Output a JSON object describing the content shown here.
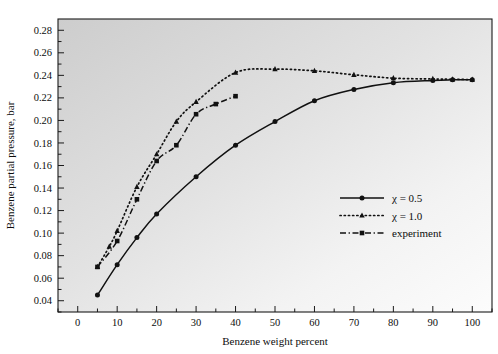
{
  "figure": {
    "background_color": "#ffffff",
    "plot_bg_light": "#fdfdfd",
    "plot_bg_dark": "#cfcfcf",
    "ink_color": "#111111"
  },
  "chart_data": {
    "type": "line",
    "title": "",
    "xlabel": "Benzene weight percent",
    "ylabel": "Benzene partial pressure, bar",
    "xlim": [
      -5,
      105
    ],
    "ylim": [
      0.03,
      0.29
    ],
    "xticks": [
      0,
      10,
      20,
      30,
      40,
      50,
      60,
      70,
      80,
      90,
      100
    ],
    "xtick_labels": [
      "0",
      "10",
      "20",
      "30",
      "40",
      "50",
      "60",
      "70",
      "80",
      "90",
      "100"
    ],
    "yticks": [
      0.04,
      0.06,
      0.08,
      0.1,
      0.12,
      0.14,
      0.16,
      0.18,
      0.2,
      0.22,
      0.24,
      0.26,
      0.28
    ],
    "ytick_labels": [
      "0.04",
      "0.06",
      "0.08",
      "0.10",
      "0.12",
      "0.14",
      "0.16",
      "0.18",
      "0.20",
      "0.22",
      "0.24",
      "0.26",
      "0.28"
    ],
    "yticks_minor": [
      0.03,
      0.05,
      0.07,
      0.09,
      0.11,
      0.13,
      0.15,
      0.17,
      0.19,
      0.21,
      0.23,
      0.25,
      0.27
    ],
    "xticks_minor": [
      -5,
      5,
      15,
      25,
      35,
      45,
      55,
      65,
      75,
      85,
      95,
      105
    ],
    "grid": false,
    "legend_position": "center-right",
    "series": [
      {
        "name": "chi-0-5",
        "label": "χ = 0.5",
        "linestyle": "solid",
        "marker": "circle",
        "x": [
          5,
          10,
          15,
          20,
          30,
          40,
          50,
          60,
          70,
          80,
          90,
          95,
          100
        ],
        "y": [
          0.045,
          0.072,
          0.096,
          0.117,
          0.15,
          0.178,
          0.199,
          0.2175,
          0.2275,
          0.2335,
          0.2355,
          0.236,
          0.2362
        ]
      },
      {
        "name": "chi-1-0",
        "label": "χ = 1.0",
        "linestyle": "dotted",
        "marker": "triangle",
        "x": [
          5,
          8,
          10,
          15,
          20,
          25,
          30,
          40,
          50,
          60,
          70,
          80,
          90,
          95,
          100
        ],
        "y": [
          0.07,
          0.088,
          0.102,
          0.141,
          0.17,
          0.199,
          0.2165,
          0.2425,
          0.2455,
          0.244,
          0.2405,
          0.2375,
          0.2368,
          0.2365,
          0.2362
        ]
      },
      {
        "name": "experiment",
        "label": "experiment",
        "linestyle": "dashdot",
        "marker": "square",
        "x": [
          5,
          10,
          15,
          20,
          25,
          30,
          35,
          40
        ],
        "y": [
          0.07,
          0.093,
          0.13,
          0.164,
          0.178,
          0.2055,
          0.2145,
          0.2215
        ]
      }
    ],
    "legend": [
      {
        "label": "χ = 0.5",
        "linestyle": "solid",
        "marker": "circle"
      },
      {
        "label": "χ = 1.0",
        "linestyle": "dotted",
        "marker": "triangle"
      },
      {
        "label": "experiment",
        "linestyle": "dashdot",
        "marker": "square"
      }
    ]
  }
}
